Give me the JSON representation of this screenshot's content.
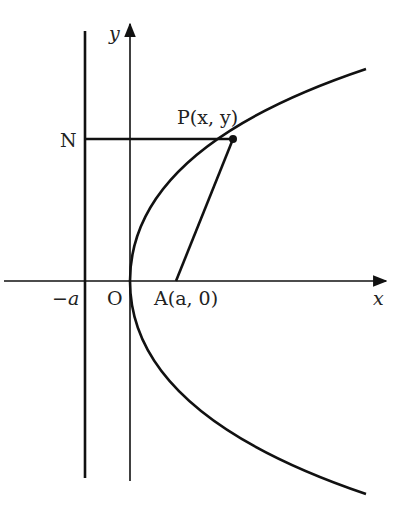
{
  "diagram": {
    "labels": {
      "y_axis": "y",
      "x_axis": "x",
      "origin": "O",
      "directrix_point": "−a",
      "focus": "A(a, 0)",
      "point_p": "P(x, y)",
      "point_n": "N"
    },
    "colors": {
      "stroke": "#111111",
      "background": "#ffffff"
    }
  }
}
